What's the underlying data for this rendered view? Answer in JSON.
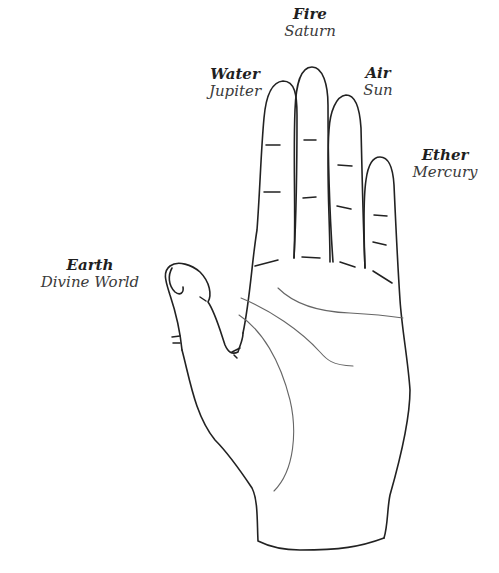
{
  "diagram": {
    "type": "labeled-illustration",
    "labels": [
      {
        "id": "thumb",
        "element": "Earth",
        "planet": "Divine World"
      },
      {
        "id": "index",
        "element": "Water",
        "planet": "Jupiter"
      },
      {
        "id": "middle",
        "element": "Fire",
        "planet": "Saturn"
      },
      {
        "id": "ring",
        "element": "Air",
        "planet": "Sun"
      },
      {
        "id": "little",
        "element": "Ether",
        "planet": "Mercury"
      }
    ]
  },
  "colors": {
    "background": "#ffffff",
    "line": "#222222",
    "palm_line": "#666666"
  }
}
